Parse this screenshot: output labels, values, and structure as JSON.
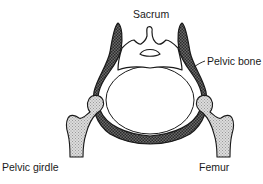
{
  "figure": {
    "style": "black-and-white anatomical line drawing",
    "colors": {
      "outline": "#1a1a1a",
      "pelvic_bone_fill": "#555555",
      "femur_fill": "#d4d4d4",
      "background": "#ffffff"
    }
  },
  "labels": {
    "sacrum": "Sacrum",
    "pelvic_bone": "Pelvic bone",
    "pelvic_girdle": "Pelvic girdle",
    "femur": "Femur"
  },
  "parts": [
    {
      "name": "sacrum",
      "fill": "white"
    },
    {
      "name": "pelvic-bone",
      "fill": "dark stipple"
    },
    {
      "name": "left-femur",
      "fill": "light stipple"
    },
    {
      "name": "right-femur",
      "fill": "light stipple"
    }
  ]
}
